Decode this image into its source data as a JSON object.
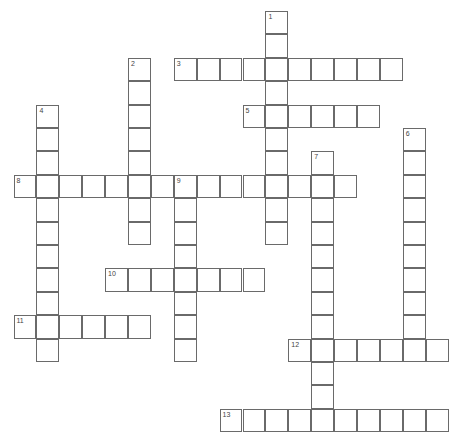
{
  "puzzle": {
    "grid": {
      "origin_x": 13.5,
      "origin_y": 11,
      "cell_w": 22.9,
      "cell_h": 23.4
    },
    "words": [
      {
        "number": "1",
        "direction": "down",
        "row": 0,
        "col": 11,
        "length": 10
      },
      {
        "number": "2",
        "direction": "down",
        "row": 2,
        "col": 5,
        "length": 8
      },
      {
        "number": "3",
        "direction": "across",
        "row": 2,
        "col": 7,
        "length": 10
      },
      {
        "number": "4",
        "direction": "down",
        "row": 4,
        "col": 1,
        "length": 11
      },
      {
        "number": "5",
        "direction": "across",
        "row": 4,
        "col": 10,
        "length": 6
      },
      {
        "number": "6",
        "direction": "down",
        "row": 5,
        "col": 17,
        "length": 10
      },
      {
        "number": "7",
        "direction": "down",
        "row": 6,
        "col": 13,
        "length": 12
      },
      {
        "number": "8",
        "direction": "across",
        "row": 7,
        "col": 0,
        "length": 15
      },
      {
        "number": "9",
        "direction": "down",
        "row": 7,
        "col": 7,
        "length": 8
      },
      {
        "number": "10",
        "direction": "across",
        "row": 11,
        "col": 4,
        "length": 7
      },
      {
        "number": "11",
        "direction": "across",
        "row": 13,
        "col": 0,
        "length": 6
      },
      {
        "number": "12",
        "direction": "across",
        "row": 14,
        "col": 12,
        "length": 7
      },
      {
        "number": "13",
        "direction": "across",
        "row": 17,
        "col": 9,
        "length": 10
      }
    ]
  }
}
